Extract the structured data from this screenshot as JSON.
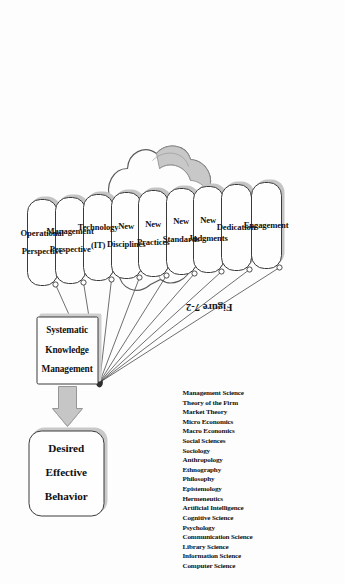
{
  "figure": {
    "caption": "Figure 7-2",
    "orientation": "rotated-90-ccw"
  },
  "nodes": {
    "outcome": {
      "label": "Desired Effective Behavior",
      "lines": [
        "Desired",
        "Effective",
        "Behavior"
      ]
    },
    "engine": {
      "label": "Systematic Knowledge Management",
      "lines": [
        "Systematic",
        "Knowledge",
        "Management"
      ]
    }
  },
  "connector": {
    "arrow_icon": "up-block-arrow",
    "from": "Systematic Knowledge Management",
    "to": "Desired Effective Behavior"
  },
  "fan_nodes": [
    {
      "label": "Operational Perspective",
      "lines": [
        "Operational",
        "Perspective"
      ]
    },
    {
      "label": "Management Perspective",
      "lines": [
        "Management",
        "Perspective"
      ]
    },
    {
      "label": "Technology (IT)",
      "lines": [
        "Technology",
        "(IT)"
      ]
    },
    {
      "label": "New Disciplines",
      "lines": [
        "New",
        "Disciplines"
      ]
    },
    {
      "label": "New Practices",
      "lines": [
        "New",
        "Practices"
      ]
    },
    {
      "label": "New Standards",
      "lines": [
        "New",
        "Standards"
      ]
    },
    {
      "label": "New Judgments",
      "lines": [
        "New",
        "Judgments"
      ]
    },
    {
      "label": "Dedication",
      "lines": [
        "Dedication"
      ]
    },
    {
      "label": "Engagement",
      "lines": [
        "Engagement"
      ]
    }
  ],
  "cloud": {
    "shape_icon": "cloud-shape",
    "disciplines": [
      "Management Science",
      "Theory of the Firm",
      "Market Theory",
      "Micro Economics",
      "Macro Economics",
      "Social Sciences",
      "Sociology",
      "Anthropology",
      "Ethnography",
      "Philosophy",
      "Epistemology",
      "Hermeneutics",
      "Artificial Intelligence",
      "Cognitive Science",
      "Psychology",
      "Communication Science",
      "Library Science",
      "Information Science",
      "Computer Science"
    ]
  },
  "colors": {
    "line": "#3a3a3a",
    "box_fill": "#fefefe",
    "shadow": "#bdbdbd",
    "arrow_fill": "#c6c6c6",
    "cloud_stroke": "#5a5a5a",
    "text": "#111111"
  }
}
